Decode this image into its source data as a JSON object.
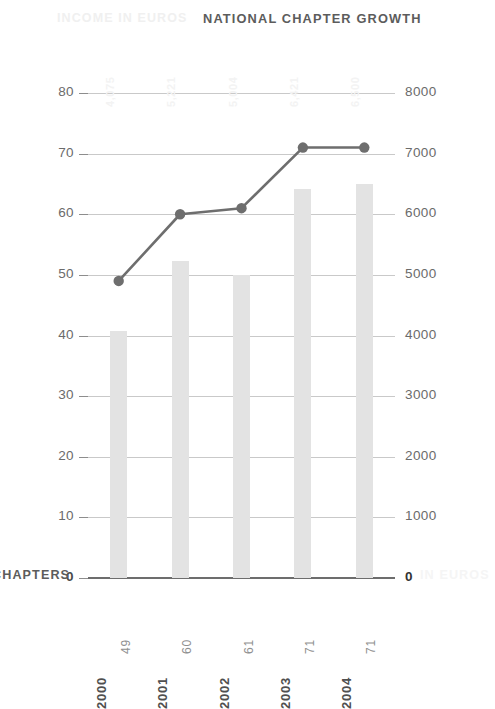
{
  "header": {
    "secondary_title": "INCOME IN EUROS",
    "primary_title": "NATIONAL CHAPTER GROWTH"
  },
  "axis_captions": {
    "left": "CHAPTERS",
    "right": "IN EUROS"
  },
  "colors": {
    "bar": "#e3e3e3",
    "line": "#6e6e6e",
    "marker": "#6e6e6e",
    "grid": "#c9c9c9",
    "baseline": "#6d6d6d",
    "title": "#5c5c5c",
    "faint_text": "#f0f0f0",
    "tick_text": "#6b6b6b"
  },
  "left_axis": {
    "label": "CHAPTERS",
    "ticks": [
      "0",
      "10",
      "20",
      "30",
      "40",
      "50",
      "60",
      "70",
      "80"
    ],
    "min": 0,
    "max": 80
  },
  "right_axis": {
    "label": "IN EUROS",
    "ticks": [
      "0",
      "1000",
      "2000",
      "3000",
      "4000",
      "5000",
      "6000",
      "7000",
      "8000"
    ],
    "min": 0,
    "max": 8000
  },
  "x_axis": {
    "years": [
      "2000",
      "2001",
      "2002",
      "2003",
      "2004"
    ],
    "chapter_counts": [
      "49",
      "60",
      "61",
      "71",
      "71"
    ]
  },
  "bar_value_labels": [
    "4,075",
    "5,221",
    "5,004",
    "6,421",
    "6,500"
  ],
  "chart_data": {
    "type": "bar",
    "title": "NATIONAL CHAPTER GROWTH",
    "subtitle": "INCOME IN EUROS",
    "xlabel": "",
    "ylabel": "CHAPTERS",
    "y2label": "IN EUROS",
    "categories": [
      "2000",
      "2001",
      "2002",
      "2003",
      "2004"
    ],
    "ylim": [
      0,
      80
    ],
    "y2lim": [
      0,
      8000
    ],
    "grid": true,
    "legend": "none",
    "series": [
      {
        "name": "IN EUROS",
        "type": "bar",
        "axis": "right",
        "values": [
          4075,
          5221,
          5004,
          6421,
          6500
        ],
        "value_labels": [
          "4,075",
          "5,221",
          "5,004",
          "6,421",
          "6,500"
        ],
        "color": "#e3e3e3"
      },
      {
        "name": "CHAPTERS",
        "type": "line",
        "axis": "left",
        "values": [
          49,
          60,
          61,
          71,
          71
        ],
        "value_labels": [
          "49",
          "60",
          "61",
          "71",
          "71"
        ],
        "color": "#6e6e6e",
        "marker": "circle"
      }
    ]
  }
}
